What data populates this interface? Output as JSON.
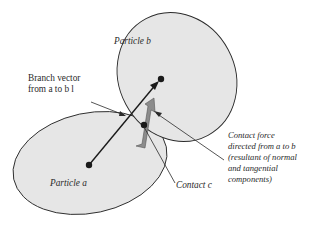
{
  "diagram": {
    "particles": [
      {
        "id": "a",
        "label": "Particle a"
      },
      {
        "id": "b",
        "label": "Particle b"
      }
    ],
    "labels": {
      "particle_a": "Particle a",
      "particle_b": "Particle b",
      "branch_vector_line1": "Branch vector",
      "branch_vector_line2": "from a to b l",
      "contact": "Contact c",
      "force_line1": "Contact force",
      "force_line2": "directed from a to b",
      "force_line3": "(resultant of normal",
      "force_line4": "and tangential",
      "force_line5": "components)"
    },
    "colors": {
      "particle_fill": "#e6e6e6",
      "outline": "#2a2a2a",
      "force_arrow": "#8c8c8c",
      "dot": "#1a1a1a"
    }
  }
}
